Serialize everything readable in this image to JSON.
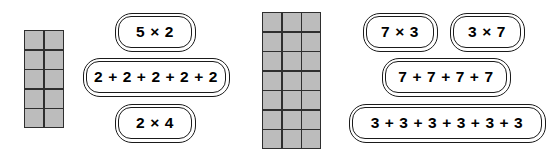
{
  "page": {
    "background_color": "#ffffff"
  },
  "colors": {
    "cell_fill": "#bcbcbc",
    "cell_border": "#2e2e2e",
    "pill_border": "#1a1a1a",
    "text": "#000000"
  },
  "groups": [
    {
      "id": "left",
      "grid": {
        "name": "array-grid-2x5",
        "columns": 2,
        "rows": 5,
        "total_cells": 10,
        "cell_count_label": "10"
      },
      "pills": [
        {
          "id": "pill-5x2",
          "name": "expression-5-times-2",
          "text": "5 × 2"
        },
        {
          "id": "pill-2plus",
          "name": "expression-2-plus-repeated",
          "text": "2 + 2 + 2 + 2 + 2"
        },
        {
          "id": "pill-2x4",
          "name": "expression-2-times-4",
          "text": "2 × 4"
        }
      ]
    },
    {
      "id": "right",
      "grid": {
        "name": "array-grid-3x7",
        "columns": 3,
        "rows": 7,
        "total_cells": 21,
        "cell_count_label": "21"
      },
      "pills": [
        {
          "id": "pill-7x3",
          "name": "expression-7-times-3",
          "text": "7 × 3"
        },
        {
          "id": "pill-3x7",
          "name": "expression-3-times-7",
          "text": "3 × 7"
        },
        {
          "id": "pill-7plus",
          "name": "expression-7-plus-repeated",
          "text": "7 + 7 + 7 + 7"
        },
        {
          "id": "pill-3plus",
          "name": "expression-3-plus-repeated",
          "text": "3 + 3 + 3 + 3 + 3 + 3"
        }
      ]
    }
  ]
}
